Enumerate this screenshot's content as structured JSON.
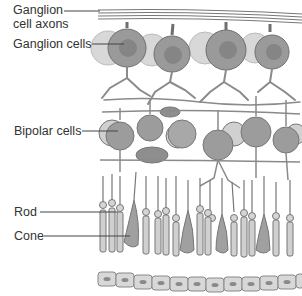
{
  "diagram": {
    "labels": [
      {
        "id": "axons",
        "line1": "Ganglion",
        "line2": "cell axons"
      },
      {
        "id": "ganglion",
        "text": "Ganglion cells"
      },
      {
        "id": "bipolar",
        "text": "Bipolar cells"
      },
      {
        "id": "rod",
        "text": "Rod"
      },
      {
        "id": "cone",
        "text": "Cone"
      }
    ],
    "colors": {
      "cell_fill": "#9a9a9a",
      "cell_light": "#c9c9c9",
      "nucleus": "#7e7e7e",
      "stroke": "#6f6f6f",
      "leader": "#444444"
    }
  }
}
